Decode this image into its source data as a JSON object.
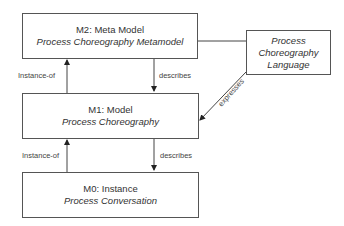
{
  "boxes": {
    "m2": {
      "title": "M2: Meta Model",
      "subtitle": "Process Choreography Metamodel"
    },
    "m1": {
      "title": "M1: Model",
      "subtitle": "Process Choreography"
    },
    "m0": {
      "title": "M0: Instance",
      "subtitle": "Process Conversation"
    },
    "language": {
      "line1": "Process",
      "line2": "Choreography",
      "line3": "Language"
    }
  },
  "edges": {
    "m1_m2_instance": "Instance-of",
    "m2_m1_describes": "describes",
    "m0_m1_instance": "Instance-of",
    "m1_m0_describes": "describes",
    "lang_m1_expresses": "expresses"
  }
}
